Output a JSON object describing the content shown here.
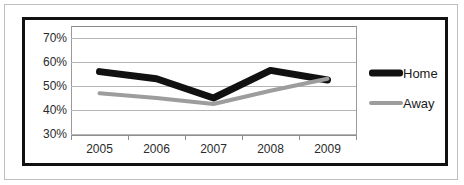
{
  "chart_data": {
    "type": "line",
    "title": "",
    "xlabel": "",
    "ylabel": "",
    "categories": [
      "2005",
      "2006",
      "2007",
      "2008",
      "2009"
    ],
    "ytick_labels": [
      "70%",
      "60%",
      "50%",
      "40%",
      "30%"
    ],
    "yticks": [
      70,
      60,
      50,
      40,
      30
    ],
    "ylim": [
      30,
      75
    ],
    "grid": true,
    "legend_position": "right",
    "series": [
      {
        "name": "Home",
        "color": "#111111",
        "line_width": 7,
        "values": [
          56,
          53,
          45,
          56.5,
          52.5
        ]
      },
      {
        "name": "Away",
        "color": "#9d9d9d",
        "line_width": 4,
        "values": [
          47,
          45,
          42.5,
          48,
          53
        ]
      }
    ]
  },
  "legend": {
    "items": [
      {
        "label": "Home",
        "swatch": "home-line-swatch"
      },
      {
        "label": "Away",
        "swatch": "away-line-swatch"
      }
    ]
  },
  "colors": {
    "home": "#111111",
    "away": "#9d9d9d",
    "gridline": "#b5b5b5",
    "axis": "#8f8f8f",
    "frame": "#111111",
    "outer_frame": "#bfbfbf",
    "text": "#2b2b2b",
    "background": "#ffffff"
  }
}
